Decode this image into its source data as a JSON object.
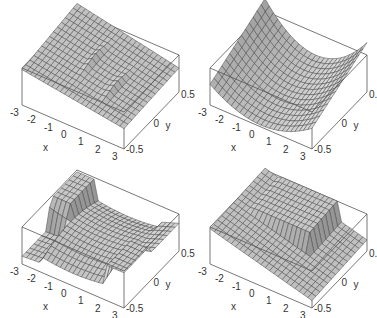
{
  "figure": {
    "layout": "2x2 grid of 3D surface plots",
    "background": "#ffffff",
    "surface_fill": "#c8c8c8",
    "surface_shadow": "#8a8a8a",
    "mesh_color": "#3a3a3a",
    "box_color": "#555555"
  },
  "chart_data": [
    {
      "type": "surface",
      "panel": "top-left",
      "xlabel": "x",
      "ylabel": "y",
      "x_ticks": [
        "-3",
        "-2",
        "-1",
        "0",
        "1",
        "2",
        "3"
      ],
      "y_ticks": [
        "-0.5",
        "0",
        "0.5"
      ],
      "xlim": [
        -3,
        3
      ],
      "ylim": [
        -0.5,
        0.5
      ],
      "description": "Gently tilted sheet rising toward back-left with two small ridge/ripple features near x=-0.5 and x=1.5",
      "shape": "tilted-with-ripples"
    },
    {
      "type": "surface",
      "panel": "top-right",
      "xlabel": "x",
      "ylabel": "y",
      "x_ticks": [
        "-3",
        "-2",
        "-1",
        "0",
        "1",
        "2",
        "3"
      ],
      "y_ticks": [
        "-0.5",
        "0",
        "0.5"
      ],
      "xlim": [
        -3,
        3
      ],
      "ylim": [
        -0.5,
        0.5
      ],
      "description": "Smooth saddle/trough surface, low near x=0, rising at both x ends, highest at back-right",
      "shape": "trough"
    },
    {
      "type": "surface",
      "panel": "bottom-left",
      "xlabel": "x",
      "ylabel": "y",
      "x_ticks": [
        "-3",
        "-2",
        "-1",
        "0",
        "1",
        "2",
        "3"
      ],
      "y_ticks": [
        "-0.5",
        "0",
        "0.5"
      ],
      "xlim": [
        -3,
        3
      ],
      "ylim": [
        -0.5,
        0.5
      ],
      "description": "Cross-shaped surface with two vertical discontinuity walls at x≈-2 and x≈2, raised flanges in the quadrants",
      "shape": "cross-with-walls"
    },
    {
      "type": "surface",
      "panel": "bottom-right",
      "xlabel": "x",
      "ylabel": "y",
      "x_ticks": [
        "-3",
        "-2",
        "-1",
        "0",
        "1",
        "2",
        "3"
      ],
      "y_ticks": [
        "-0.5",
        "0",
        "0.5"
      ],
      "xlim": [
        -3,
        3
      ],
      "ylim": [
        -0.5,
        0.5
      ],
      "description": "Tilted front sheet sloping down to the right, with a raised back plateau separated by a vertical wall at x≈1.5",
      "shape": "step-wall"
    }
  ],
  "panels": [
    {
      "id": "p1",
      "left": 0,
      "top": 0,
      "shape": "tilted-with-ripples"
    },
    {
      "id": "p2",
      "left": 188,
      "top": 0,
      "shape": "trough"
    },
    {
      "id": "p3",
      "left": 0,
      "top": 159,
      "shape": "cross-with-walls"
    },
    {
      "id": "p4",
      "left": 188,
      "top": 159,
      "shape": "step-wall"
    }
  ],
  "labels": {
    "x_axis": "x",
    "y_axis": "y",
    "x_ticks": [
      "-3",
      "-2",
      "-1",
      "0",
      "1",
      "2",
      "3"
    ],
    "y_ticks": [
      "-0.5",
      "0",
      "0.5"
    ]
  }
}
